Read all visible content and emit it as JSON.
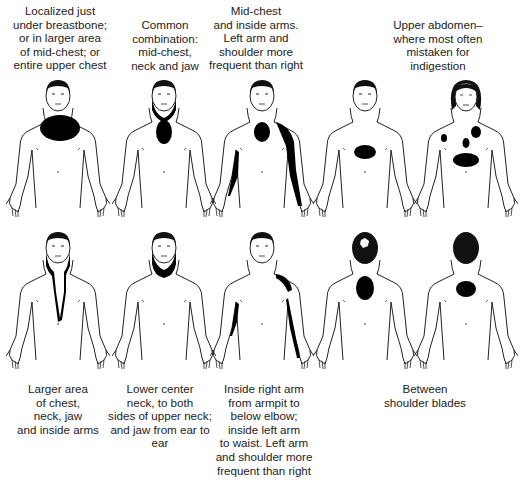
{
  "top_row": [
    {
      "id": "chest",
      "caption": "Localized just\nunder breastbone;\nor in larger area\nof mid-chest; or\nentire upper chest",
      "view": "front",
      "sex": "male"
    },
    {
      "id": "chest-neck-jaw",
      "caption": "Common\ncombination:\nmid-chest,\nneck and jaw",
      "view": "front",
      "sex": "male"
    },
    {
      "id": "chest-arms",
      "caption": "Mid-chest\nand inside arms.\nLeft arm and\nshoulder more\nfrequent than right",
      "view": "front",
      "sex": "male"
    },
    {
      "id": "upper-abdomen",
      "caption": "Upper abdomen–\nwhere most often\nmistaken for\nindigestion",
      "view": "front",
      "sex": "male"
    },
    {
      "id": "female-multi",
      "caption": "",
      "view": "front",
      "sex": "female"
    }
  ],
  "bottom_row": [
    {
      "id": "large-chest-neck-jaw-arms",
      "caption": "Larger area\nof chest,\nneck, jaw\nand inside arms",
      "view": "front",
      "sex": "male"
    },
    {
      "id": "lower-neck-jaw",
      "caption": "Lower center\nneck, to both\nsides of upper neck;\nand jaw from ear to ear",
      "view": "front",
      "sex": "male"
    },
    {
      "id": "inside-arms",
      "caption": "Inside right arm\nfrom armpit to\nbelow elbow;\ninside left arm\nto waist. Left arm\nand shoulder more\nfrequent than right",
      "view": "front",
      "sex": "male"
    },
    {
      "id": "between-shoulders-male",
      "caption": "Between\nshoulder blades",
      "view": "back",
      "sex": "male"
    },
    {
      "id": "between-shoulders-female",
      "caption": "",
      "view": "back",
      "sex": "female"
    }
  ],
  "colors": {
    "pain": "#000000",
    "outline": "#222222",
    "background": "#ffffff"
  }
}
